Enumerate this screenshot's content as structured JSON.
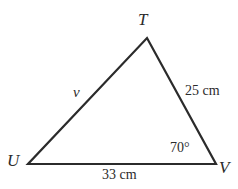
{
  "figure": {
    "type": "triangle-diagram",
    "background_color": "#ffffff",
    "stroke_color": "#2b2b2b",
    "text_color": "#2b2b2b",
    "vertices": [
      {
        "name": "T",
        "label": "T",
        "x": 147,
        "y": 38
      },
      {
        "name": "U",
        "label": "U",
        "x": 28,
        "y": 164
      },
      {
        "name": "V",
        "label": "V",
        "x": 216,
        "y": 164
      }
    ],
    "sides": [
      {
        "name": "side-UT",
        "label": "v",
        "from": "U",
        "to": "T",
        "italic": true
      },
      {
        "name": "side-TV",
        "label": "25 cm",
        "from": "T",
        "to": "V",
        "italic": false
      },
      {
        "name": "side-UV",
        "label": "33 cm",
        "from": "U",
        "to": "V",
        "italic": false
      }
    ],
    "angles": [
      {
        "name": "angle-V",
        "label": "70°",
        "at": "V",
        "value": 70,
        "unit": "degrees"
      }
    ]
  }
}
